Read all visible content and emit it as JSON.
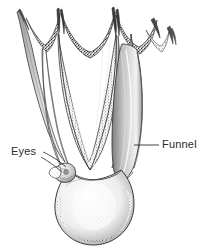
{
  "figure": {
    "style": "stippled pen-and-ink scientific illustration",
    "background_color": "#ffffff",
    "ink_color": "#2b2b2b",
    "width": 209,
    "height": 248
  },
  "labels": [
    {
      "id": "eyes",
      "text": "Eyes",
      "side": "left",
      "text_x": 11,
      "text_y": 146,
      "leader": {
        "type": "double-line",
        "from_x": 43,
        "from_y": 154,
        "to_x": 68,
        "to_y": 170
      }
    },
    {
      "id": "funnel",
      "text": "Funnel",
      "side": "right",
      "text_x": 162,
      "text_y": 139,
      "leader": {
        "type": "horizontal-line",
        "from_x": 158,
        "from_y": 145,
        "to_x": 134,
        "to_y": 145
      }
    }
  ],
  "anatomy": {
    "arm_count": 8,
    "parts": [
      "arm-tips",
      "web-membrane",
      "arms",
      "funnel",
      "eyes",
      "mantle"
    ]
  },
  "colors": {
    "ink": "#2b2b2b",
    "outline": "#3a3a3a",
    "web_dark": "#4a4a4a",
    "shade_mid": "#8d8d8d",
    "shade_light": "#c9c9c9",
    "paper": "#ffffff"
  }
}
